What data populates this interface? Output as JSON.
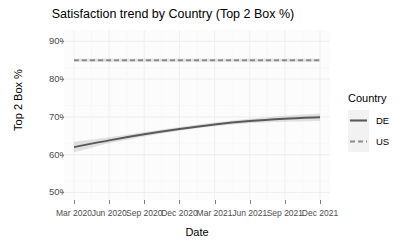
{
  "chart_data": {
    "type": "line",
    "title": "Satisfaction trend by Country (Top 2 Box %)",
    "xlabel": "Date",
    "ylabel": "Top 2 Box %",
    "x_tick_labels": [
      "Mar 2020",
      "Jun 2020",
      "Sep 2020",
      "Dec 2020",
      "Mar 2021",
      "Jun 2021",
      "Sep 2021",
      "Dec 2021"
    ],
    "y_tick_labels": [
      "90%",
      "80%",
      "70%",
      "60%",
      "50%"
    ],
    "y_tick_values": [
      90,
      80,
      70,
      60,
      50
    ],
    "ylim": [
      48,
      93
    ],
    "grid": true,
    "legend_position": "right",
    "legend_title": "Country",
    "series": [
      {
        "name": "DE",
        "linestyle": "solid",
        "color": "#595959",
        "x": [
          "Mar 2020",
          "Jun 2020",
          "Sep 2020",
          "Dec 2020",
          "Mar 2021",
          "Jun 2021",
          "Sep 2021",
          "Dec 2021"
        ],
        "values": [
          62.0,
          63.8,
          65.4,
          66.8,
          68.0,
          68.9,
          69.5,
          69.9
        ],
        "ribbon_low": [
          60.6,
          63.0,
          64.8,
          66.3,
          67.5,
          68.3,
          68.7,
          68.9
        ],
        "ribbon_high": [
          63.4,
          64.6,
          66.0,
          67.3,
          68.5,
          69.5,
          70.3,
          70.9
        ]
      },
      {
        "name": "US",
        "linestyle": "dashed",
        "color": "#8c8c8c",
        "x": [
          "Mar 2020",
          "Jun 2020",
          "Sep 2020",
          "Dec 2020",
          "Mar 2021",
          "Jun 2021",
          "Sep 2021",
          "Dec 2021"
        ],
        "values": [
          85.0,
          85.0,
          85.0,
          85.0,
          85.0,
          85.0,
          85.0,
          85.0
        ],
        "ribbon_low": [
          84.6,
          84.6,
          84.6,
          84.6,
          84.6,
          84.6,
          84.6,
          84.6
        ],
        "ribbon_high": [
          85.4,
          85.4,
          85.4,
          85.4,
          85.4,
          85.4,
          85.4,
          85.4
        ]
      }
    ]
  },
  "legend": {
    "title": "Country",
    "items": [
      {
        "label": "DE"
      },
      {
        "label": "US"
      }
    ]
  },
  "colors": {
    "de_line": "#595959",
    "us_line": "#8c8c8c",
    "ribbon": "#b3b3b3",
    "panel_bg": "#fcfcfc",
    "grid": "#f0f0f0",
    "tick_text": "#4d4d4d"
  }
}
